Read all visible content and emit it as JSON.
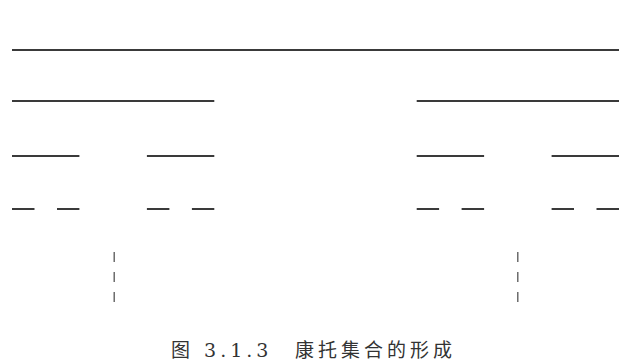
{
  "figure": {
    "caption": "图 3.1.3　康托集合的形成",
    "line_color": "#3a3a3a",
    "iterations": [
      {
        "level": 0,
        "intervals": [
          [
            0,
            1
          ]
        ]
      },
      {
        "level": 1,
        "intervals": [
          [
            0,
            0.3333
          ],
          [
            0.6667,
            1
          ]
        ]
      },
      {
        "level": 2,
        "intervals": [
          [
            0,
            0.1111
          ],
          [
            0.2222,
            0.3333
          ],
          [
            0.6667,
            0.7778
          ],
          [
            0.8889,
            1
          ]
        ]
      },
      {
        "level": 3,
        "intervals": [
          [
            0,
            0.037
          ],
          [
            0.0741,
            0.1111
          ],
          [
            0.2222,
            0.2593
          ],
          [
            0.2963,
            0.3333
          ],
          [
            0.6667,
            0.7037
          ],
          [
            0.7407,
            0.7778
          ],
          [
            0.8889,
            0.9259
          ],
          [
            0.963,
            1
          ]
        ]
      }
    ],
    "continuation_markers": [
      {
        "position": 0.1667,
        "dash_count": 3
      },
      {
        "position": 0.8333,
        "dash_count": 3
      }
    ]
  }
}
